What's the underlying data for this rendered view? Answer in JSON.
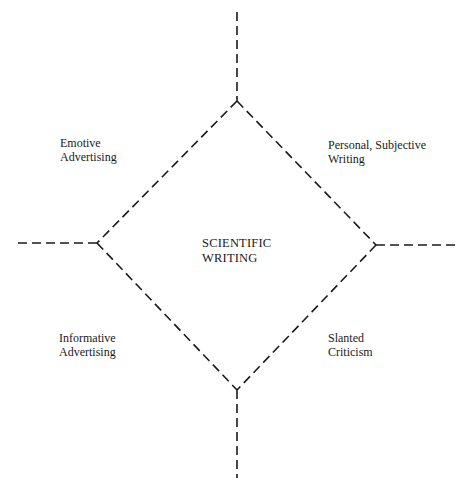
{
  "diagram": {
    "center": {
      "line1": "SCIENTIFIC",
      "line2": "WRITING"
    },
    "quadrants": [
      {
        "position": "top-left",
        "line1": "Emotive",
        "line2": "Advertising"
      },
      {
        "position": "top-right",
        "line1": "Personal, Subjective",
        "line2": "Writing"
      },
      {
        "position": "bottom-left",
        "line1": "Informative",
        "line2": "Advertising"
      },
      {
        "position": "bottom-right",
        "line1": "Slanted",
        "line2": "Criticism"
      }
    ],
    "line_style": "dashed",
    "line_color": "#1a1a1a"
  }
}
